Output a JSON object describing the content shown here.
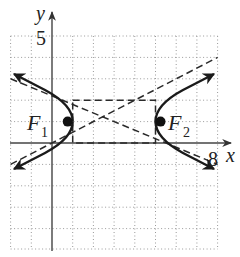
{
  "diagram": {
    "type": "hyperbola-graph",
    "equation": "(x-3)^2/4 - (y-1)^2/1 = 1",
    "axes": {
      "x_label": "x",
      "y_label": "y",
      "x_tick_label": "8",
      "y_tick_label": "5",
      "x_range": [
        -2,
        8
      ],
      "y_range": [
        -5,
        5
      ],
      "grid_step": 1
    },
    "center": [
      3,
      1
    ],
    "a": 2,
    "b": 1,
    "fundamental_rectangle": {
      "x": [
        1,
        5
      ],
      "y": [
        0,
        2
      ]
    },
    "asymptotes": [
      "y - 1 = (x - 3)/2",
      "y - 1 = -(x - 3)/2"
    ],
    "foci": [
      {
        "label": "F",
        "subscript": "1",
        "point": [
          0.76,
          1
        ]
      },
      {
        "label": "F",
        "subscript": "2",
        "point": [
          5.24,
          1
        ]
      }
    ],
    "colors": {
      "curve": "#1a1a1a",
      "grid": "#9a9a9a",
      "axis": "#444444",
      "dashed": "#2a2a2a"
    }
  }
}
